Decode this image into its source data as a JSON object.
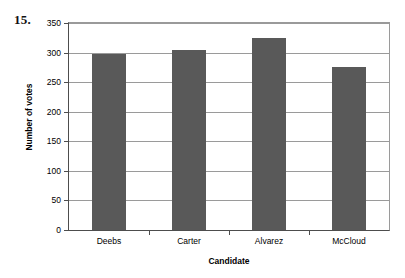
{
  "question_number": "15.",
  "chart_data": {
    "type": "bar",
    "title": "",
    "xlabel": "Candidate",
    "ylabel": "Number of votes",
    "categories": [
      "Deebs",
      "Carter",
      "Alvarez",
      "McCloud"
    ],
    "values": [
      298,
      304,
      325,
      275
    ],
    "ylim": [
      0,
      350
    ],
    "ytick_values": [
      0,
      50,
      100,
      150,
      200,
      250,
      300,
      350
    ],
    "ytick_labels": [
      "0",
      "50",
      "100",
      "150",
      "200",
      "250",
      "300",
      "350"
    ],
    "grid": "horizontal",
    "legend": "none",
    "bar_color": "#595959",
    "axis_color": "#4d4d4d",
    "gridline_color": "#9a9a9a",
    "background": "#ffffff"
  }
}
